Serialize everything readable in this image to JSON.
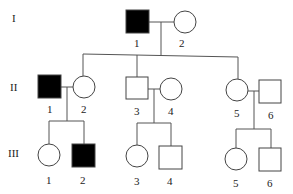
{
  "generations": [
    {
      "label": "I"
    },
    {
      "label": "II"
    },
    {
      "label": "III"
    }
  ],
  "individuals": {
    "I": [
      {
        "num": "1",
        "sex": "male",
        "affected": true
      },
      {
        "num": "2",
        "sex": "female",
        "affected": false
      }
    ],
    "II": [
      {
        "num": "1",
        "sex": "male",
        "affected": true
      },
      {
        "num": "2",
        "sex": "female",
        "affected": false
      },
      {
        "num": "3",
        "sex": "male",
        "affected": false
      },
      {
        "num": "4",
        "sex": "female",
        "affected": false
      },
      {
        "num": "5",
        "sex": "female",
        "affected": false
      },
      {
        "num": "6",
        "sex": "male",
        "affected": false
      }
    ],
    "III": [
      {
        "num": "1",
        "sex": "female",
        "affected": false
      },
      {
        "num": "2",
        "sex": "male",
        "affected": true
      },
      {
        "num": "3",
        "sex": "female",
        "affected": false
      },
      {
        "num": "4",
        "sex": "male",
        "affected": false
      },
      {
        "num": "5",
        "sex": "female",
        "affected": false
      },
      {
        "num": "6",
        "sex": "male",
        "affected": false
      }
    ]
  },
  "colors": {
    "affected": "#000000",
    "unaffected": "#ffffff",
    "line": "#555555"
  }
}
